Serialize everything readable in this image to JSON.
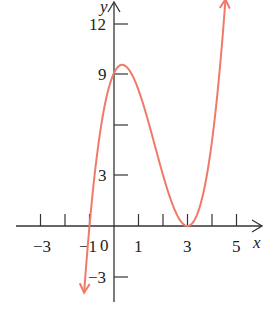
{
  "chart_data": {
    "type": "line",
    "title": "",
    "xlabel": "x",
    "ylabel": "y",
    "function": "(x+1)(x-3)^2",
    "xlim": [
      -3.5,
      6
    ],
    "ylim": [
      -4.5,
      13
    ],
    "x_ticks": [
      -3,
      -2,
      -1,
      0,
      1,
      2,
      3,
      4,
      5
    ],
    "x_tick_labels": [
      "-3",
      "-1",
      "0",
      "1",
      "3",
      "5"
    ],
    "y_ticks": [
      -3,
      3,
      6,
      9,
      12
    ],
    "y_tick_labels": [
      "-3",
      "3",
      "9",
      "12"
    ],
    "grid": false,
    "series": [
      {
        "name": "f(x)",
        "color": "#f07a6a",
        "x": [
          -1.22,
          -1,
          -0.5,
          0,
          0.333,
          1,
          1.5,
          2,
          2.5,
          3,
          3.5,
          4,
          4.55
        ],
        "y": [
          -3.63,
          0,
          6.13,
          9,
          9.48,
          8,
          5.63,
          3,
          0.88,
          0,
          1.13,
          5,
          13.3
        ]
      }
    ],
    "key_points": [
      {
        "label": "x-intercept",
        "x": -1,
        "y": 0
      },
      {
        "label": "y-intercept",
        "x": 0,
        "y": 9
      },
      {
        "label": "local max",
        "x": 0.33,
        "y": 9.48
      },
      {
        "label": "local min / double root",
        "x": 3,
        "y": 0
      }
    ]
  },
  "labels": {
    "x_axis": "x",
    "y_axis": "y",
    "origin": "0",
    "xm3": "−3",
    "xm1": "−1",
    "x1": "1",
    "x3": "3",
    "x5": "5",
    "y12": "12",
    "y9": "9",
    "y3": "3",
    "ym3": "−3"
  }
}
